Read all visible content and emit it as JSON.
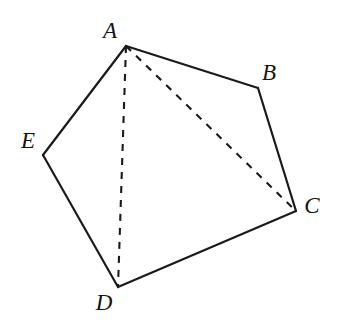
{
  "figure": {
    "kind": "geometry-diagram",
    "background_color": "#ffffff",
    "stroke_color": "#1a1a1a",
    "width": 340,
    "height": 325,
    "vertices": [
      {
        "id": "A",
        "label": "A",
        "x": 126,
        "y": 46,
        "label_x": 110,
        "label_y": 30
      },
      {
        "id": "B",
        "label": "B",
        "x": 258,
        "y": 88,
        "label_x": 269,
        "label_y": 72
      },
      {
        "id": "C",
        "label": "C",
        "x": 296,
        "y": 211,
        "label_x": 312,
        "label_y": 205
      },
      {
        "id": "D",
        "label": "D",
        "x": 118,
        "y": 287,
        "label_x": 104,
        "label_y": 302
      },
      {
        "id": "E",
        "label": "E",
        "x": 43,
        "y": 155,
        "label_x": 28,
        "label_y": 140
      }
    ],
    "edges": [
      {
        "id": "AB",
        "from": "A",
        "to": "B",
        "style": "solid"
      },
      {
        "id": "BC",
        "from": "B",
        "to": "C",
        "style": "solid"
      },
      {
        "id": "CD",
        "from": "C",
        "to": "D",
        "style": "solid"
      },
      {
        "id": "DE",
        "from": "D",
        "to": "E",
        "style": "solid"
      },
      {
        "id": "EA",
        "from": "E",
        "to": "A",
        "style": "solid"
      }
    ],
    "diagonals": [
      {
        "id": "AC",
        "from": "A",
        "to": "C",
        "style": "dashed"
      },
      {
        "id": "AD",
        "from": "A",
        "to": "D",
        "style": "dashed"
      }
    ]
  }
}
